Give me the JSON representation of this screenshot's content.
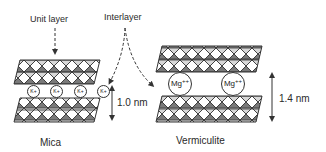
{
  "labels": {
    "unit_layer": "Unit layer",
    "interlayer": "Interlayer",
    "mica": "Mica",
    "vermiculite": "Vermiculite",
    "mica_spacing": "1.0 nm",
    "vermiculite_spacing": "1.4 nm"
  },
  "ions": {
    "mica": [
      "K+",
      "K+",
      "K+",
      "K+"
    ],
    "vermiculite": [
      "Mg",
      "Mg"
    ],
    "vermiculite_charge": "++"
  },
  "colors": {
    "line": "#333333",
    "fill_dark": "#555555",
    "fill_light": "#bbbbbb",
    "background": "#ffffff"
  }
}
